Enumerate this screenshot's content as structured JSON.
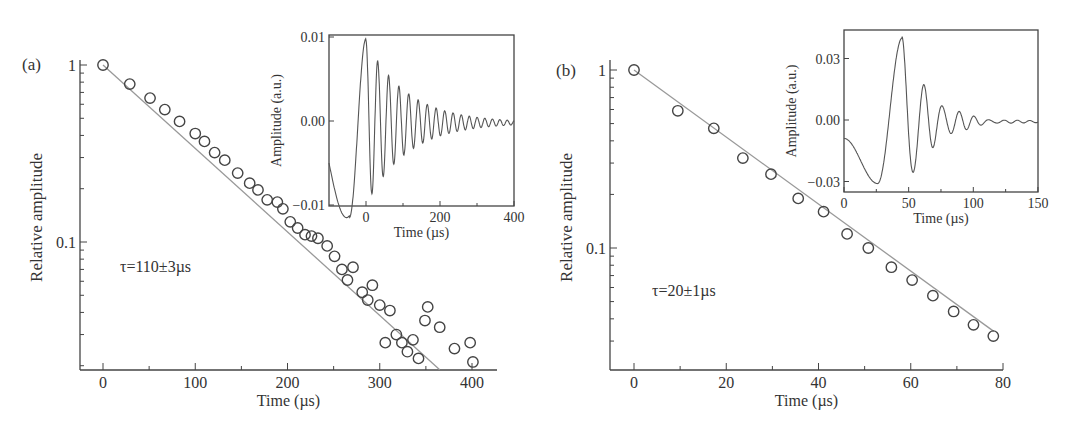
{
  "figure": {
    "panels": [
      {
        "label": "(a)",
        "xlabel": "Time (µs)",
        "ylabel": "Relative amplitude",
        "annotation": "τ=110±3µs",
        "x_ticks": [
          "0",
          "100",
          "200",
          "300",
          "400"
        ],
        "y_ticks": [
          "1",
          "0.1"
        ],
        "inset": {
          "xlabel": "Time (µs)",
          "ylabel": "Amplitude (a.u.)",
          "x_ticks": [
            "0",
            "200",
            "400"
          ],
          "y_ticks": [
            "0.01",
            "0.00",
            "−0.01"
          ]
        }
      },
      {
        "label": "(b)",
        "xlabel": "Time (µs)",
        "ylabel": "Relative amplitude",
        "annotation": "τ=20±1µs",
        "x_ticks": [
          "0",
          "20",
          "40",
          "60",
          "80"
        ],
        "y_ticks": [
          "1",
          "0.1"
        ],
        "inset": {
          "xlabel": "Time (µs)",
          "ylabel": "Amplitude (a.u.)",
          "x_ticks": [
            "0",
            "50",
            "100",
            "150"
          ],
          "y_ticks": [
            "0.03",
            "0.00",
            "−0.03"
          ]
        }
      }
    ]
  },
  "chart_data": [
    {
      "type": "scatter",
      "panel": "(a)",
      "title": "",
      "xlabel": "Time (µs)",
      "ylabel": "Relative amplitude",
      "yscale": "log",
      "xlim": [
        -25,
        425
      ],
      "ylim": [
        0.019,
        1.2
      ],
      "grid": false,
      "annotation": "τ=110±3µs",
      "series": [
        {
          "name": "measured",
          "marker": "open-circle",
          "x": [
            0,
            29,
            51,
            67,
            83,
            100,
            110,
            121,
            132,
            146,
            159,
            168,
            178,
            189,
            195,
            203,
            211,
            219,
            226,
            233,
            243,
            251,
            259,
            271,
            265,
            281,
            287,
            292,
            300,
            311,
            306,
            318,
            324,
            330,
            336,
            342,
            349,
            352,
            365,
            381,
            398,
            401
          ],
          "y": [
            1.0,
            0.78,
            0.65,
            0.56,
            0.48,
            0.41,
            0.37,
            0.32,
            0.29,
            0.245,
            0.215,
            0.197,
            0.173,
            0.168,
            0.154,
            0.13,
            0.12,
            0.11,
            0.108,
            0.105,
            0.095,
            0.083,
            0.07,
            0.072,
            0.061,
            0.052,
            0.047,
            0.057,
            0.044,
            0.041,
            0.027,
            0.03,
            0.027,
            0.024,
            0.028,
            0.022,
            0.036,
            0.043,
            0.033,
            0.025,
            0.027,
            0.021
          ]
        },
        {
          "name": "exponential fit",
          "style": "line",
          "x": [
            0,
            365
          ],
          "y": [
            1.0,
            0.019
          ]
        }
      ],
      "inset": {
        "type": "line",
        "xlabel": "Time (µs)",
        "ylabel": "Amplitude (a.u.)",
        "xlim": [
          -100,
          400
        ],
        "ylim": [
          -0.0128,
          0.0105
        ],
        "x_ticks": [
          0,
          200,
          400
        ],
        "y_ticks": [
          0.01,
          0.0,
          -0.01
        ],
        "description": "Damped oscillation: starts ~-0.005 at -100, min ~-0.0115 at -45, peak ~0.0098 at 0, decaying oscillations (~33 µs period) to ~0 by 400"
      }
    },
    {
      "type": "scatter",
      "panel": "(b)",
      "title": "",
      "xlabel": "Time (µs)",
      "ylabel": "Relative amplitude",
      "yscale": "log",
      "xlim": [
        -5,
        80
      ],
      "ylim": [
        0.027,
        1.2
      ],
      "grid": false,
      "annotation": "τ=20±1µs",
      "series": [
        {
          "name": "measured",
          "marker": "open-circle",
          "x": [
            0,
            9.5,
            17.3,
            23.6,
            29.7,
            35.6,
            41.1,
            46.2,
            50.8,
            55.8,
            60.3,
            64.8,
            69.3,
            73.6,
            77.9
          ],
          "y": [
            1.0,
            0.59,
            0.47,
            0.32,
            0.26,
            0.19,
            0.16,
            0.12,
            0.1,
            0.078,
            0.066,
            0.054,
            0.044,
            0.037,
            0.032
          ]
        },
        {
          "name": "exponential fit",
          "style": "line",
          "x": [
            0,
            78
          ],
          "y": [
            1.0,
            0.034
          ]
        }
      ],
      "inset": {
        "type": "line",
        "xlabel": "Time (µs)",
        "ylabel": "Amplitude (a.u.)",
        "xlim": [
          0,
          150
        ],
        "ylim": [
          -0.035,
          0.044
        ],
        "x_ticks": [
          0,
          50,
          100,
          150
        ],
        "y_ticks": [
          0.03,
          0.0,
          -0.03
        ],
        "description": "Damped oscillation: starts ~-0.009 at 0, min ~-0.031 at 26, peak ~0.040 at 45, decaying oscillations (~13 µs period) to ~0 by 150"
      }
    }
  ]
}
